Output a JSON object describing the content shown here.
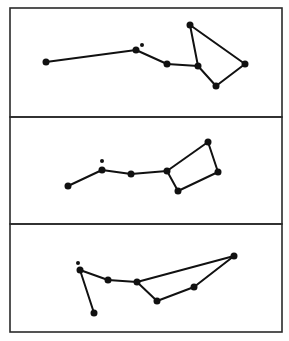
{
  "figure": {
    "width": 289,
    "height": 341,
    "background": "#ffffff",
    "ink_color": "#111111",
    "frame_color": "#2a2a2a",
    "panels": [
      {
        "name": "panel-1",
        "box": {
          "x": 10,
          "y": 8,
          "w": 272,
          "h": 109
        },
        "stars": [
          {
            "x": 46,
            "y": 62,
            "r": 3.5
          },
          {
            "x": 136,
            "y": 50,
            "r": 3.5
          },
          {
            "x": 167,
            "y": 64,
            "r": 3.5
          },
          {
            "x": 198,
            "y": 66,
            "r": 3.5
          },
          {
            "x": 190,
            "y": 25,
            "r": 3.5
          },
          {
            "x": 245,
            "y": 64,
            "r": 3.5
          },
          {
            "x": 216,
            "y": 86,
            "r": 3.5
          }
        ],
        "edges": [
          [
            0,
            1
          ],
          [
            1,
            2
          ],
          [
            2,
            3
          ],
          [
            3,
            4
          ],
          [
            4,
            5
          ],
          [
            5,
            6
          ],
          [
            6,
            3
          ]
        ],
        "extra_dot": {
          "x": 142,
          "y": 45,
          "r": 2
        }
      },
      {
        "name": "panel-2",
        "box": {
          "x": 10,
          "y": 117,
          "w": 272,
          "h": 107
        },
        "stars": [
          {
            "x": 68,
            "y": 186,
            "r": 3.5
          },
          {
            "x": 102,
            "y": 170,
            "r": 3.5
          },
          {
            "x": 131,
            "y": 174,
            "r": 3.5
          },
          {
            "x": 167,
            "y": 171,
            "r": 3.5
          },
          {
            "x": 208,
            "y": 142,
            "r": 3.5
          },
          {
            "x": 218,
            "y": 172,
            "r": 3.5
          },
          {
            "x": 178,
            "y": 191,
            "r": 3.5
          }
        ],
        "edges": [
          [
            0,
            1
          ],
          [
            1,
            2
          ],
          [
            2,
            3
          ],
          [
            3,
            4
          ],
          [
            4,
            5
          ],
          [
            5,
            6
          ],
          [
            6,
            3
          ]
        ],
        "extra_dot": {
          "x": 102,
          "y": 161,
          "r": 2
        }
      },
      {
        "name": "panel-3",
        "box": {
          "x": 10,
          "y": 224,
          "w": 272,
          "h": 108
        },
        "stars": [
          {
            "x": 94,
            "y": 313,
            "r": 3.5
          },
          {
            "x": 80,
            "y": 270,
            "r": 3.5
          },
          {
            "x": 108,
            "y": 280,
            "r": 3.5
          },
          {
            "x": 137,
            "y": 282,
            "r": 3.5
          },
          {
            "x": 234,
            "y": 256,
            "r": 3.5
          },
          {
            "x": 194,
            "y": 287,
            "r": 3.5
          },
          {
            "x": 157,
            "y": 301,
            "r": 3.5
          }
        ],
        "edges": [
          [
            0,
            1
          ],
          [
            1,
            2
          ],
          [
            2,
            3
          ],
          [
            3,
            4
          ],
          [
            4,
            5
          ],
          [
            5,
            6
          ],
          [
            6,
            3
          ]
        ],
        "extra_dot": {
          "x": 78,
          "y": 263,
          "r": 2
        }
      }
    ]
  }
}
